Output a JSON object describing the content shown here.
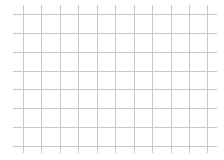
{
  "chart_data": {
    "type": "line",
    "title": "",
    "xlabel": "",
    "ylabel": "",
    "series": [],
    "grid": true,
    "legend": null,
    "x_gridlines_px": [
      23,
      41,
      60,
      78,
      97,
      115,
      134,
      152,
      171,
      189,
      207
    ],
    "y_gridlines_px": [
      14,
      33,
      52,
      71,
      89,
      108,
      127,
      146
    ],
    "x_tick_labels": [],
    "y_tick_labels": []
  },
  "style": {
    "grid_color": "#c8c8c8",
    "background": "#ffffff"
  }
}
